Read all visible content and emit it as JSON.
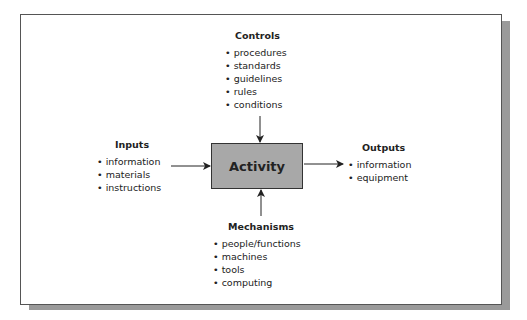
{
  "activity": {
    "label": "Activity",
    "fill": "#a8a8a8"
  },
  "controls": {
    "title": "Controls",
    "items": [
      "procedures",
      "standards",
      "guidelines",
      "rules",
      "conditions"
    ]
  },
  "inputs": {
    "title": "Inputs",
    "items": [
      "information",
      "materials",
      "instructions"
    ]
  },
  "outputs": {
    "title": "Outputs",
    "items": [
      "information",
      "equipment"
    ]
  },
  "mechanisms": {
    "title": "Mechanisms",
    "items": [
      "people/functions",
      "machines",
      "tools",
      "computing"
    ]
  }
}
